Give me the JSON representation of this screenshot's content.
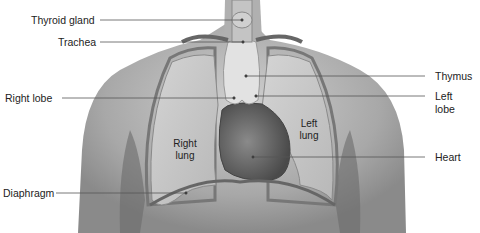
{
  "diagram": {
    "labels": {
      "thyroid_gland": "Thyroid gland",
      "trachea": "Trachea",
      "right_lobe": "Right lobe",
      "diaphragm": "Diaphragm",
      "thymus": "Thymus",
      "left_lobe_1": "Left",
      "left_lobe_2": "lobe",
      "heart": "Heart",
      "right_lung_1": "Right",
      "right_lung_2": "lung",
      "left_lung_1": "Left",
      "left_lung_2": "lung"
    },
    "colors": {
      "skin": "#b9b9b9",
      "skin_dark": "#7a7a7a",
      "lung": "#c9c9c9",
      "thymus": "#e4e4e4",
      "heart": "#6a6a6a",
      "leader_line": "#555555"
    }
  }
}
